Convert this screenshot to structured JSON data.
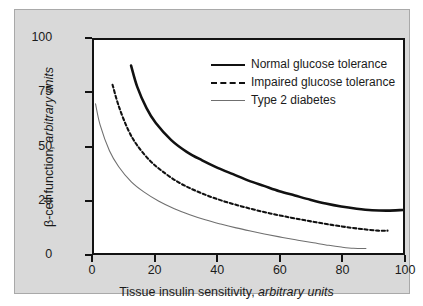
{
  "figure": {
    "background_color": "#d9d9d9",
    "page_color": "#ffffff",
    "plot_background": "#ffffff",
    "axis_color": "#131313"
  },
  "chart_data": {
    "type": "line",
    "title": "",
    "xlabel_main": "Tissue insulin sensitivity,",
    "xlabel_units": "arbitrary units",
    "ylabel_main": "β-cell function,",
    "ylabel_units": "arbitrary units",
    "xlim": [
      0,
      100
    ],
    "ylim": [
      0,
      100
    ],
    "xticks": [
      0,
      20,
      40,
      60,
      80,
      100
    ],
    "xtick_labels": [
      "0",
      "20",
      "40",
      "60",
      "80",
      "100"
    ],
    "yticks": [
      0,
      25,
      50,
      75,
      100
    ],
    "ytick_labels": [
      "0",
      "25",
      "50",
      "75",
      "100"
    ],
    "grid": false,
    "legend_position": "upper right",
    "series": [
      {
        "name": "Normal glucose tolerance",
        "style": "solid",
        "width": 2.6,
        "color": "#111111",
        "x": [
          12,
          14,
          17,
          20,
          25,
          30,
          35,
          40,
          45,
          50,
          55,
          60,
          65,
          70,
          75,
          80,
          85,
          90,
          95,
          100
        ],
        "y": [
          88,
          78,
          68,
          61,
          53,
          47.5,
          43.5,
          40,
          37,
          34,
          31.5,
          29,
          27,
          25,
          23.2,
          21.8,
          20.8,
          20.1,
          19.9,
          20.2
        ]
      },
      {
        "name": "Impaired glucose tolerance",
        "style": "dashed",
        "width": 2.1,
        "color": "#111111",
        "x": [
          6,
          8,
          11,
          14,
          18,
          22,
          27,
          32,
          37,
          42,
          47,
          52,
          57,
          62,
          67,
          72,
          77,
          82,
          87,
          92,
          95
        ],
        "y": [
          79,
          69,
          58,
          50.5,
          43.5,
          38.5,
          33.5,
          29.8,
          26.8,
          24.3,
          22.2,
          20.3,
          18.6,
          17.1,
          15.7,
          14.4,
          13.2,
          12.1,
          11.2,
          10.5,
          10.5
        ]
      },
      {
        "name": "Type 2 diabetes",
        "style": "solid",
        "width": 1.1,
        "color": "#6f6f6f",
        "x": [
          0.5,
          2,
          5,
          8,
          12,
          16,
          21,
          26,
          31,
          36,
          41,
          46,
          51,
          56,
          61,
          66,
          71,
          76,
          80,
          84,
          88
        ],
        "y": [
          70,
          60,
          48,
          40.5,
          33.5,
          28.8,
          24.3,
          20.8,
          18,
          15.6,
          13.6,
          11.8,
          10.2,
          8.7,
          7.3,
          6.0,
          4.8,
          3.6,
          2.8,
          2.2,
          2.1
        ]
      }
    ]
  },
  "legend": {
    "items": [
      {
        "label": "Normal glucose tolerance",
        "swatch": "solid-thick"
      },
      {
        "label": "Impaired glucose tolerance",
        "swatch": "dashed"
      },
      {
        "label": "Type 2 diabetes",
        "swatch": "solid-thin"
      }
    ]
  }
}
